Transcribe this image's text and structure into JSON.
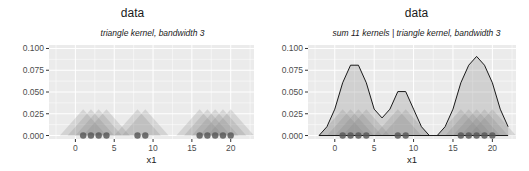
{
  "chart_data": [
    {
      "type": "area",
      "title": "data",
      "subtitle": "triangle kernel, bandwidth 3",
      "xlabel": "x1",
      "ylabel": "",
      "xlim": [
        -3.4,
        23
      ],
      "ylim": [
        -0.004,
        0.104
      ],
      "x_ticks": [
        0,
        5,
        10,
        15,
        20
      ],
      "y_ticks": [
        "0.000",
        "0.025",
        "0.050",
        "0.075",
        "0.100"
      ],
      "grid": true,
      "points_x": [
        1,
        2,
        3,
        4,
        8,
        9,
        16,
        17,
        18,
        19,
        20
      ],
      "kernel": "triangle",
      "bandwidth": 3,
      "kernel_peak": 0.0303,
      "description": "Individual triangle kernels (one per point) drawn as translucent grey triangles, each spanning x-3 to x+3 with peak 0.0303"
    },
    {
      "type": "area",
      "title": "data",
      "subtitle": "sum 11 kernels | triangle kernel, bandwidth 3",
      "xlabel": "x1",
      "ylabel": "",
      "xlim": [
        -3.4,
        23
      ],
      "ylim": [
        -0.004,
        0.104
      ],
      "x_ticks": [
        0,
        5,
        10,
        15,
        20
      ],
      "y_ticks": [
        "0.000",
        "0.025",
        "0.050",
        "0.075",
        "0.100"
      ],
      "grid": true,
      "points_x": [
        1,
        2,
        3,
        4,
        8,
        9,
        16,
        17,
        18,
        19,
        20
      ],
      "series": [
        {
          "name": "density sum",
          "x": [
            -2,
            -1,
            0,
            1,
            2,
            3,
            4,
            5,
            6,
            7,
            8,
            9,
            10,
            11,
            12
          ],
          "values": [
            0,
            0.0101,
            0.0303,
            0.0606,
            0.0808,
            0.0808,
            0.0606,
            0.0303,
            0.0202,
            0.0303,
            0.0505,
            0.0505,
            0.0303,
            0.0101,
            0
          ]
        },
        {
          "name": "density sum (right cluster)",
          "x": [
            13,
            14,
            15,
            16,
            17,
            18,
            19,
            20,
            21,
            22
          ],
          "values": [
            0,
            0.0101,
            0.0303,
            0.0606,
            0.0808,
            0.0909,
            0.0808,
            0.0606,
            0.0303,
            0.0101
          ]
        }
      ]
    }
  ],
  "colors": {
    "panel_bg": "#ebebeb",
    "grid": "#ffffff",
    "kernel_fill": "#7f7f7f",
    "point": "#595959",
    "line": "#1a1a1a",
    "text": "#4d4d4d"
  }
}
